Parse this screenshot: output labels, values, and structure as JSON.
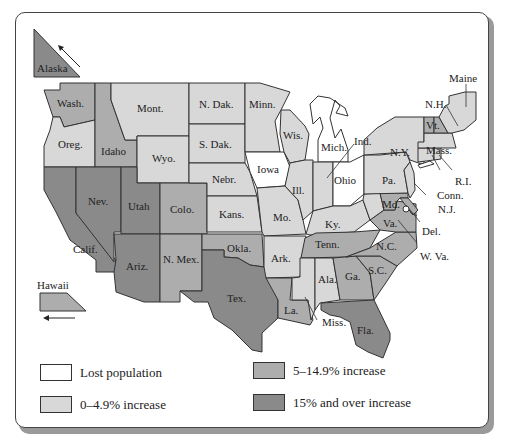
{
  "colors": {
    "lost": "#ffffff",
    "low": "#d8d8d8",
    "mid": "#adadad",
    "high": "#8a8a8a",
    "border": "#333333"
  },
  "legend": [
    {
      "key": "lost",
      "label": "Lost population"
    },
    {
      "key": "low",
      "label": "0–4.9% increase"
    },
    {
      "key": "mid",
      "label": "5–14.9% increase"
    },
    {
      "key": "high",
      "label": "15% and over increase"
    }
  ],
  "insets": {
    "alaska": {
      "label": "Alaska",
      "category": "high"
    },
    "hawaii": {
      "label": "Hawaii",
      "category": "mid"
    }
  },
  "states": {
    "wa": {
      "label": "Wash.",
      "category": "mid"
    },
    "or": {
      "label": "Oreg.",
      "category": "low"
    },
    "ca": {
      "label": "Calif.",
      "category": "high"
    },
    "nv": {
      "label": "Nev.",
      "category": "high"
    },
    "id": {
      "label": "Idaho",
      "category": "mid"
    },
    "mt": {
      "label": "Mont.",
      "category": "low"
    },
    "wy": {
      "label": "Wyo.",
      "category": "low"
    },
    "ut": {
      "label": "Utah",
      "category": "high"
    },
    "az": {
      "label": "Ariz.",
      "category": "high"
    },
    "co": {
      "label": "Colo.",
      "category": "mid"
    },
    "nm": {
      "label": "N. Mex.",
      "category": "mid"
    },
    "nd": {
      "label": "N. Dak.",
      "category": "low"
    },
    "sd": {
      "label": "S. Dak.",
      "category": "low"
    },
    "ne": {
      "label": "Nebr.",
      "category": "low"
    },
    "ks": {
      "label": "Kans.",
      "category": "low"
    },
    "ok": {
      "label": "Okla.",
      "category": "mid"
    },
    "tx": {
      "label": "Tex.",
      "category": "high"
    },
    "mn": {
      "label": "Minn.",
      "category": "low"
    },
    "ia": {
      "label": "Iowa",
      "category": "lost"
    },
    "mo": {
      "label": "Mo.",
      "category": "low"
    },
    "ar": {
      "label": "Ark.",
      "category": "low"
    },
    "la": {
      "label": "La.",
      "category": "mid"
    },
    "wi": {
      "label": "Wis.",
      "category": "low"
    },
    "il": {
      "label": "Ill.",
      "category": "low"
    },
    "mi": {
      "label": "Mich.",
      "category": "lost"
    },
    "in": {
      "label": "Ind.",
      "category": "low"
    },
    "oh": {
      "label": "Ohio",
      "category": "lost"
    },
    "ky": {
      "label": "Ky.",
      "category": "low"
    },
    "tn": {
      "label": "Tenn.",
      "category": "mid"
    },
    "ms": {
      "label": "Miss.",
      "category": "low"
    },
    "al": {
      "label": "Ala.",
      "category": "low"
    },
    "ga": {
      "label": "Ga.",
      "category": "mid"
    },
    "fl": {
      "label": "Fla.",
      "category": "high"
    },
    "sc": {
      "label": "S.C.",
      "category": "mid"
    },
    "nc": {
      "label": "N.C.",
      "category": "mid"
    },
    "va": {
      "label": "Va.",
      "category": "mid"
    },
    "wv": {
      "label": "W. Va.",
      "category": "low"
    },
    "md": {
      "label": "Md.",
      "category": "mid"
    },
    "de": {
      "label": "Del.",
      "category": "mid"
    },
    "pa": {
      "label": "Pa.",
      "category": "low"
    },
    "nj": {
      "label": "N.J.",
      "category": "low"
    },
    "ny": {
      "label": "N.Y.",
      "category": "low"
    },
    "ct": {
      "label": "Conn.",
      "category": "low"
    },
    "ri": {
      "label": "R.I.",
      "category": "low"
    },
    "ma": {
      "label": "Mass.",
      "category": "low"
    },
    "vt": {
      "label": "Vt.",
      "category": "mid"
    },
    "nh": {
      "label": "N.H.",
      "category": "mid"
    },
    "me": {
      "label": "Maine",
      "category": "low"
    }
  }
}
